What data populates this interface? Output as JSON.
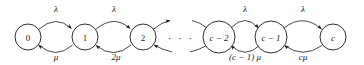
{
  "diagram": {
    "type": "markov-chain-state-diagram",
    "colors": {
      "stroke": "#1a1a1a",
      "fill": "#ffffff",
      "background": "#ffffff"
    },
    "ellipsis": "· · ·",
    "states": [
      {
        "id": "s0",
        "label": "0",
        "cx": 28,
        "cy": 37,
        "r": 13
      },
      {
        "id": "s1",
        "label": "1",
        "cx": 85,
        "cy": 37,
        "r": 13
      },
      {
        "id": "s2",
        "label": "2",
        "cx": 143,
        "cy": 37,
        "r": 13
      },
      {
        "id": "sc2",
        "label": "c − 2",
        "cx": 219,
        "cy": 37,
        "r": 16
      },
      {
        "id": "sc1",
        "label": "c − 1",
        "cx": 271,
        "cy": 37,
        "r": 16
      },
      {
        "id": "sc",
        "label": "c",
        "cx": 333,
        "cy": 37,
        "r": 13
      }
    ],
    "birth_rates": [
      {
        "from": "0",
        "to": "1",
        "label": "λ",
        "x": 56,
        "y": 9
      },
      {
        "from": "1",
        "to": "2",
        "label": "λ",
        "x": 114,
        "y": 9
      },
      {
        "from": "c − 2",
        "to": "c − 1",
        "label": "λ",
        "x": 245,
        "y": 9
      },
      {
        "from": "c − 1",
        "to": "c",
        "label": "λ",
        "x": 303,
        "y": 9
      }
    ],
    "death_rates": [
      {
        "from": "1",
        "to": "0",
        "label": "μ",
        "x": 56,
        "y": 57
      },
      {
        "from": "2",
        "to": "1",
        "label": "2μ",
        "x": 116,
        "y": 57
      },
      {
        "from": "c − 1",
        "to": "c − 2",
        "label": "(c − 1) μ",
        "x": 245,
        "y": 57
      },
      {
        "from": "c",
        "to": "c − 1",
        "label": "cμ",
        "x": 303,
        "y": 57
      }
    ]
  }
}
